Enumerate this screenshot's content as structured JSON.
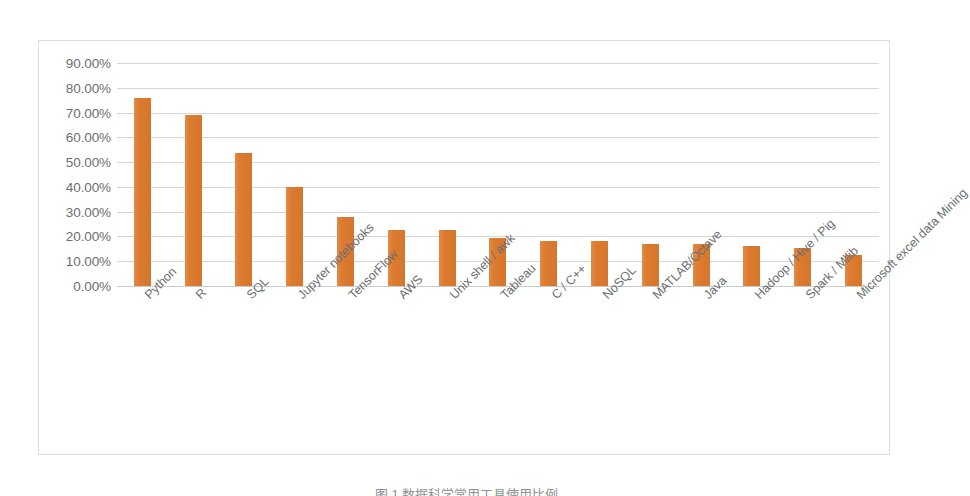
{
  "caption": "图 1  数据科学常用工具使用比例",
  "chart": {
    "bar_color": "#dd7b2f",
    "gridline_color": "#d5d8da",
    "border_color": "#d9dcdf",
    "label_color": "#6d6e71"
  },
  "chart_data": {
    "type": "bar",
    "title": "",
    "xlabel": "",
    "ylabel": "",
    "ylim": [
      0,
      90
    ],
    "grid": true,
    "legend": "none",
    "value_suffix": "%",
    "tick_labels": [
      "90.00%",
      "80.00%",
      "70.00%",
      "60.00%",
      "50.00%",
      "40.00%",
      "30.00%",
      "20.00%",
      "10.00%",
      "0.00%"
    ],
    "ticks": [
      90,
      80,
      70,
      60,
      50,
      40,
      30,
      20,
      10,
      0
    ],
    "categories": [
      "Python",
      "R",
      "SQL",
      "Jupyter notebooks",
      "TensorFlow",
      "AWS",
      "Unix shell / awk",
      "Tableau",
      "C / C++",
      "NoSQL",
      "MATLAB/Octave",
      "Java",
      "Hadoop / Hive / Pig",
      "Spark / Mllib",
      "Microsoft excel data Mining"
    ],
    "values": [
      76.0,
      69.0,
      53.5,
      40.0,
      28.0,
      22.8,
      22.7,
      19.4,
      18.2,
      18.2,
      17.0,
      17.0,
      16.1,
      15.3,
      12.4
    ]
  }
}
